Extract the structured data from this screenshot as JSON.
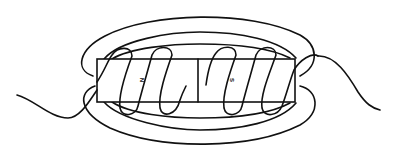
{
  "diagram": {
    "magnet": {
      "poles": [
        {
          "label": "N",
          "side": "left"
        },
        {
          "label": "S",
          "side": "right"
        }
      ]
    },
    "colors": {
      "line": "#111111",
      "background": "#ffffff"
    }
  }
}
